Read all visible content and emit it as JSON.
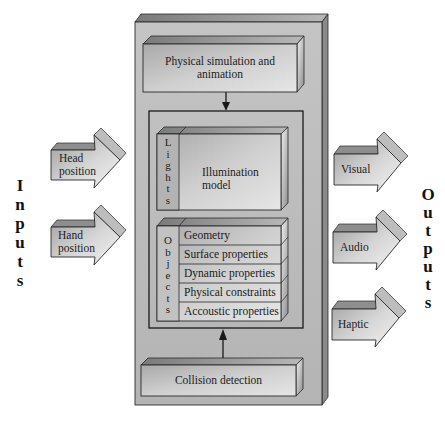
{
  "diagram": {
    "side_labels": {
      "inputs": "I n p u t s",
      "outputs": "O u t p u t s",
      "inputs_letters": [
        "I",
        "n",
        "p",
        "u",
        "t",
        "s"
      ],
      "outputs_letters": [
        "O",
        "u",
        "t",
        "p",
        "u",
        "t",
        "s"
      ]
    },
    "inputs": [
      {
        "line1": "Head",
        "line2": "position"
      },
      {
        "line1": "Hand",
        "line2": "position"
      }
    ],
    "outputs": [
      {
        "label": "Visual"
      },
      {
        "label": "Audio"
      },
      {
        "label": "Haptic"
      }
    ],
    "simulation": {
      "line1": "Physical simulation and",
      "line2": "animation"
    },
    "lights": {
      "tab_letters": [
        "L",
        "i",
        "g",
        "h",
        "t",
        "s"
      ],
      "model_line1": "Illumination",
      "model_line2": "model"
    },
    "objects": {
      "tab_letters": [
        "O",
        "b",
        "j",
        "e",
        "c",
        "t",
        "s"
      ],
      "properties": [
        "Geometry",
        "Surface properties",
        "Dynamic properties",
        "Physical constraints",
        "Accoustic properties"
      ]
    },
    "collision": {
      "label": "Collision detection"
    },
    "colors": {
      "outer_face": "#bdbdbd",
      "box_face": "#c9c9c9",
      "box_top": "#8f8f8f",
      "box_side": "#a6a6a6",
      "line": "#2a2a2a"
    }
  }
}
